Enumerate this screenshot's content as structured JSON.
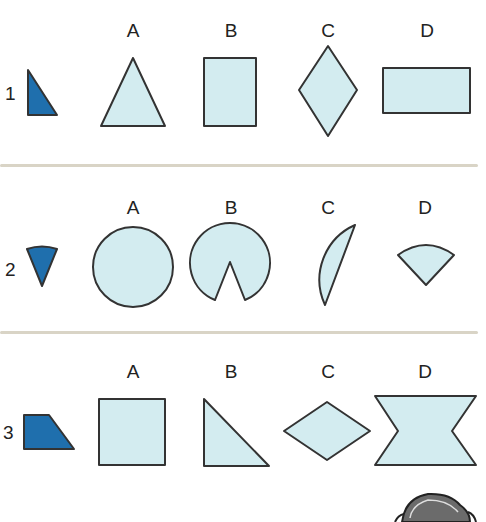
{
  "colors": {
    "shape_fill": "#d3ecf0",
    "target_fill": "#1f6fad",
    "stroke": "#333333",
    "divider": "#d9d4c6"
  },
  "rows": [
    {
      "number": "1",
      "target": "dark-blue-right-triangle",
      "options": [
        {
          "label": "A",
          "shape": "triangle"
        },
        {
          "label": "B",
          "shape": "square"
        },
        {
          "label": "C",
          "shape": "rhombus"
        },
        {
          "label": "D",
          "shape": "rectangle"
        }
      ]
    },
    {
      "number": "2",
      "target": "dark-blue-circle-sector",
      "options": [
        {
          "label": "A",
          "shape": "circle"
        },
        {
          "label": "B",
          "shape": "circle-with-notch"
        },
        {
          "label": "C",
          "shape": "semicircle-segment"
        },
        {
          "label": "D",
          "shape": "sector"
        }
      ]
    },
    {
      "number": "3",
      "target": "dark-blue-trapezoid",
      "options": [
        {
          "label": "A",
          "shape": "square"
        },
        {
          "label": "B",
          "shape": "right-triangle"
        },
        {
          "label": "C",
          "shape": "rhombus"
        },
        {
          "label": "D",
          "shape": "bowtie"
        }
      ]
    }
  ]
}
